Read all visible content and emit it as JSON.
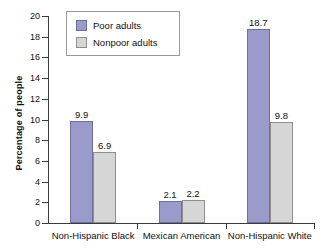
{
  "chart_data": {
    "type": "bar",
    "title": "",
    "xlabel": "",
    "ylabel": "Percentage of people",
    "ylim": [
      0,
      20
    ],
    "yticks": [
      0,
      2,
      4,
      6,
      8,
      10,
      12,
      14,
      16,
      18,
      20
    ],
    "ytick_labels": [
      "0",
      "2",
      "4",
      "6",
      "8",
      "10",
      "12",
      "14",
      "16",
      "18",
      "20"
    ],
    "grid": false,
    "legend_position": "top-left-inside",
    "categories": [
      "Non-Hispanic Black",
      "Mexican American",
      "Non-Hispanic White"
    ],
    "series": [
      {
        "name": "Poor adults",
        "color": "#9a9acb",
        "border_color": "#6f6f9b",
        "values": [
          9.9,
          2.1,
          18.7
        ],
        "labels": [
          "9.9",
          "2.1",
          "18.7"
        ]
      },
      {
        "name": "Nonpoor adults",
        "color": "#d6d6d6",
        "border_color": "#8e8e8e",
        "values": [
          6.9,
          2.2,
          9.8
        ],
        "labels": [
          "6.9",
          "2.2",
          "9.8"
        ]
      }
    ]
  },
  "axis": {
    "line_color": "#3c3c3c"
  }
}
